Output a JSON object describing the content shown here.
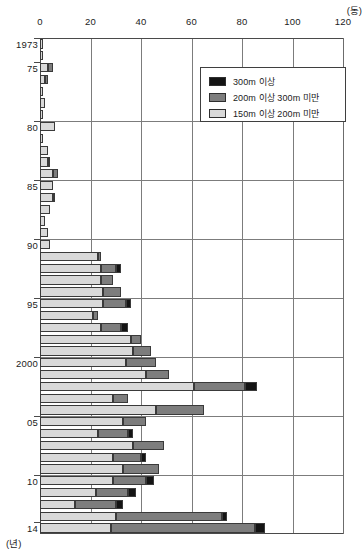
{
  "chart_data": {
    "type": "bar",
    "orientation": "horizontal",
    "stacked": true,
    "title": "",
    "xlabel": "(동)",
    "ylabel": "(년)",
    "xlim": [
      0,
      120
    ],
    "xticks": [
      0,
      20,
      40,
      60,
      80,
      100,
      120
    ],
    "xtick_labels": [
      "0",
      "20",
      "40",
      "60",
      "80",
      "100",
      "120"
    ],
    "ylim_labels": [
      "1973",
      "75",
      "80",
      "85",
      "90",
      "95",
      "2000",
      "05",
      "10",
      "14"
    ],
    "grid": "vertical-and-5yr-horizontal",
    "legend_position": "top-right-inside",
    "legend": [
      "300m 이상",
      "200m 이상 300m 미만",
      "150m 이상 200m 미만"
    ],
    "series": [
      {
        "name": "150m 이상 200m 미만",
        "color": "#d9d9d9",
        "values": [
          1,
          1,
          3,
          2,
          1,
          2,
          1,
          6,
          1,
          3,
          3,
          5,
          5,
          5,
          4,
          2,
          3,
          4,
          23,
          24,
          24,
          25,
          25,
          21,
          24,
          36,
          37,
          34,
          42,
          61,
          29,
          46,
          33,
          23,
          37,
          29,
          33,
          29,
          22,
          14,
          30,
          28
        ]
      },
      {
        "name": "200m 이상 300m 미만",
        "color": "#7d7d7d",
        "values": [
          0,
          0,
          2,
          1,
          0,
          0,
          0,
          0,
          0,
          0,
          1,
          2,
          0,
          1,
          0,
          0,
          0,
          0,
          1,
          6,
          5,
          7,
          9,
          2,
          8,
          4,
          7,
          12,
          9,
          20,
          6,
          19,
          9,
          12,
          12,
          11,
          14,
          13,
          13,
          16,
          42,
          57
        ]
      },
      {
        "name": "300m 이상",
        "color": "#141414",
        "values": [
          0,
          0,
          0,
          0,
          0,
          0,
          0,
          0,
          0,
          0,
          0,
          0,
          0,
          0,
          0,
          0,
          0,
          0,
          0,
          2,
          0,
          0,
          2,
          0,
          3,
          0,
          0,
          0,
          0,
          5,
          0,
          0,
          0,
          2,
          0,
          2,
          0,
          3,
          3,
          3,
          2,
          4
        ]
      }
    ],
    "years": [
      "1973",
      "1974",
      "1975",
      "1976",
      "1977",
      "1978",
      "1979",
      "1980",
      "1981",
      "1982",
      "1983",
      "1984",
      "1985",
      "1986",
      "1987",
      "1988",
      "1989",
      "1990",
      "1991",
      "1992",
      "1993",
      "1994",
      "1995",
      "1996",
      "1997",
      "1998",
      "1999",
      "2000",
      "2001",
      "2002",
      "2003",
      "2004",
      "2005",
      "2006",
      "2007",
      "2008",
      "2009",
      "2010",
      "2011",
      "2012",
      "2013",
      "2014"
    ]
  },
  "axes": {
    "x_unit_label": "(동)",
    "y_unit_label": "(년)"
  },
  "legend": {
    "items": [
      {
        "label": "300m 이상",
        "swatch": "s300"
      },
      {
        "label": "200m 이상 300m 미만",
        "swatch": "s200"
      },
      {
        "label": "150m 이상 200m 미만",
        "swatch": "s150"
      }
    ]
  },
  "y_axis_labels": [
    {
      "text": "1973",
      "year": "1973"
    },
    {
      "text": "75",
      "year": "1975"
    },
    {
      "text": "80",
      "year": "1980"
    },
    {
      "text": "85",
      "year": "1985"
    },
    {
      "text": "90",
      "year": "1990"
    },
    {
      "text": "95",
      "year": "1995"
    },
    {
      "text": "2000",
      "year": "2000"
    },
    {
      "text": "05",
      "year": "2005"
    },
    {
      "text": "10",
      "year": "2010"
    },
    {
      "text": "14",
      "year": "2014"
    }
  ]
}
